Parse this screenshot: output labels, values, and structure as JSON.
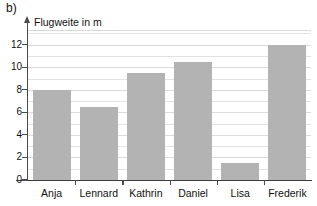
{
  "figure": {
    "part_label": "b)",
    "axis_title": "Flugweite in m"
  },
  "chart_data": {
    "type": "bar",
    "title": "Flugweite in m",
    "subtitle": "",
    "xlabel": "",
    "ylabel": "Flugweite in m",
    "categories": [
      "Anja",
      "Lennard",
      "Kathrin",
      "Daniel",
      "Lisa",
      "Frederik"
    ],
    "values": [
      8,
      6.5,
      9.5,
      10.5,
      1.5,
      12
    ],
    "series": [
      {
        "name": "Flugweite in m",
        "values": [
          8,
          6.5,
          9.5,
          10.5,
          1.5,
          12
        ]
      }
    ],
    "ylim": [
      0,
      13.3
    ],
    "ytick_labels": [
      "0",
      "2",
      "4",
      "6",
      "8",
      "10",
      "12"
    ],
    "ytick_values": [
      0,
      2,
      4,
      6,
      8,
      10,
      12
    ],
    "gridline_values": [
      1,
      2,
      3,
      4,
      5,
      6,
      7,
      8,
      9,
      10,
      11,
      12,
      13
    ],
    "grid": true,
    "legend": false,
    "legend_position": "none",
    "bar_color": "#b3b3b3",
    "gridline_color": "#e2e2e2",
    "axis_color": "#3d3d3d",
    "background_color": "#ffffff"
  }
}
